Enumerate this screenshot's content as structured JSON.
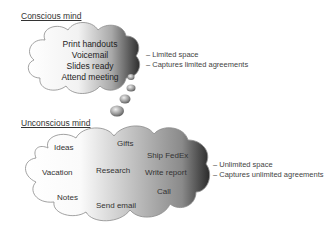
{
  "conscious": {
    "heading": "Conscious mind",
    "items": [
      "Print handouts",
      "Voicemail",
      "Slides ready",
      "Attend meeting"
    ],
    "notes": [
      "– Limited space",
      "– Captures limited agreements"
    ]
  },
  "unconscious": {
    "heading": "Unconscious mind",
    "items": {
      "ideas": "Ideas",
      "gifts": "Gifts",
      "ship": "Ship FedEx",
      "vacation": "Vacation",
      "research": "Research",
      "write": "Write report",
      "call": "Call",
      "notes": "Notes",
      "email": "Send email"
    },
    "notes": [
      "– Unlimited space",
      "– Captures unlimited agreements"
    ]
  },
  "colors": {
    "cloud_light": "#ffffff",
    "cloud_dark": "#3a3a3a",
    "outline": "#8a8a8a"
  }
}
